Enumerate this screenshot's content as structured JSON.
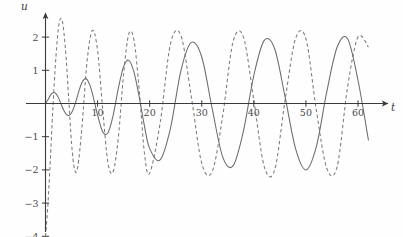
{
  "chart_data": {
    "type": "line",
    "title": "",
    "xlabel": "t",
    "ylabel": "u",
    "xlim": [
      -2,
      64
    ],
    "ylim": [
      -4.4,
      2.6
    ],
    "grid": false,
    "legend": "none",
    "x_ticks": [
      10,
      20,
      30,
      40,
      50,
      60
    ],
    "x_tick_labels": [
      "10",
      "20",
      "30",
      "40",
      "50",
      "60"
    ],
    "y_ticks": [
      2,
      1,
      -1,
      -2,
      -3,
      -4
    ],
    "y_tick_labels": [
      "2",
      "1",
      "−1",
      "−2",
      "−3",
      "−4"
    ],
    "series": [
      {
        "name": "solid",
        "style": "solid",
        "color": "#6b6b6b",
        "description": "Growing-then-steady oscillation starting near 0 amplitude, rising to about 2",
        "formula": "u = 2*sin(0.5*t)*sin(0.9*t) envelope-limited",
        "envelope_start": 0.0,
        "envelope_end": 2.0,
        "period": 6.4,
        "x": [
          0,
          0.5,
          1,
          1.5,
          2,
          2.5,
          3,
          3.5,
          4,
          4.5,
          5,
          5.5,
          6,
          6.5,
          7,
          7.5,
          8,
          8.5,
          9,
          9.5,
          10,
          11,
          12,
          13,
          14,
          15,
          16,
          17,
          18,
          19,
          20,
          22,
          24,
          26,
          28,
          30,
          32,
          34,
          36,
          38,
          40,
          42,
          44,
          46,
          48,
          50,
          52,
          54,
          56,
          58,
          60,
          62
        ],
        "y": [
          0,
          0.12,
          0.26,
          0.33,
          0.3,
          0.17,
          -0.02,
          -0.2,
          -0.33,
          -0.36,
          -0.28,
          -0.1,
          0.15,
          0.42,
          0.63,
          0.74,
          0.72,
          0.56,
          0.3,
          -0.02,
          -0.35,
          -0.86,
          -0.88,
          -0.35,
          0.47,
          1.12,
          1.3,
          0.94,
          0.19,
          -0.68,
          -1.36,
          -1.7,
          -0.74,
          0.99,
          1.84,
          1.4,
          -0.15,
          -1.6,
          -1.88,
          -0.83,
          0.85,
          1.9,
          1.65,
          0.2,
          -1.35,
          -2.0,
          -1.3,
          0.35,
          1.7,
          1.95,
          0.7,
          -1.1
        ]
      },
      {
        "name": "dashed",
        "style": "dashed",
        "color": "#7a7a7a",
        "description": "Large initial negative excursion to about -4, oscillating and settling to amplitude about 2",
        "envelope_start": 4.0,
        "envelope_end": 2.0,
        "period": 6.2,
        "x": [
          0,
          0.4,
          0.9,
          1.4,
          2,
          2.6,
          3.2,
          3.8,
          4.4,
          5,
          5.6,
          6.2,
          7,
          8,
          9,
          10,
          11,
          12,
          13,
          14,
          15,
          16,
          17,
          18,
          19,
          20,
          22,
          24,
          26,
          28,
          30,
          32,
          34,
          36,
          38,
          40,
          42,
          44,
          46,
          48,
          50,
          52,
          54,
          56,
          58,
          60,
          62
        ],
        "y": [
          -4.0,
          -3.2,
          -1.8,
          -0.2,
          1.4,
          2.4,
          2.5,
          1.7,
          0.3,
          -1.2,
          -2.0,
          -1.9,
          -0.7,
          1.3,
          2.2,
          1.6,
          -0.2,
          -1.8,
          -2.05,
          -1.0,
          0.9,
          2.1,
          1.9,
          0.4,
          -1.5,
          -2.1,
          -0.6,
          1.8,
          2.05,
          0.2,
          -1.8,
          -2.05,
          -0.4,
          1.85,
          2.0,
          0.1,
          -1.9,
          -2.0,
          0.1,
          1.95,
          1.95,
          -0.2,
          -1.95,
          -1.9,
          0.5,
          2.0,
          1.7
        ]
      }
    ],
    "annotations": []
  },
  "axes": {
    "y_axis_label": "u",
    "x_axis_label": "t",
    "arrow_x": true,
    "arrow_y": true
  }
}
